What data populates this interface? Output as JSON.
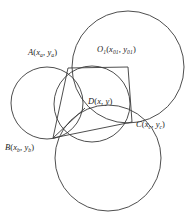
{
  "figure": {
    "kind": "geometry-diagram",
    "background_color": "#ffffff",
    "stroke_color": "#3a3a3a",
    "text_color": "#1c1c1c",
    "width": 189,
    "height": 224
  },
  "labels": {
    "a": {
      "point": "A",
      "coords": "(x_a, y_a)",
      "x": 28,
      "y": 48
    },
    "o1": {
      "point": "O",
      "subscript": "1",
      "coords": "(x_01, y_01)",
      "x": 97,
      "y": 45
    },
    "d": {
      "point": "D",
      "coords": "(x, y)",
      "x": 88,
      "y": 97
    },
    "c": {
      "point": "C",
      "coords": "(x_c, y_c)",
      "x": 136,
      "y": 120
    },
    "b": {
      "point": "B",
      "coords": "(x_b, y_b)",
      "x": 5,
      "y": 143
    }
  },
  "points": {
    "A": {
      "x": 68,
      "y": 68
    },
    "O1": {
      "x": 128,
      "y": 67
    },
    "D": {
      "x": 85,
      "y": 108
    },
    "C": {
      "x": 132,
      "y": 122
    },
    "B": {
      "x": 53,
      "y": 138
    }
  },
  "circles": [
    {
      "name": "circle-top-right",
      "cx": 128,
      "cy": 67,
      "r": 56
    },
    {
      "name": "circle-left",
      "cx": 47,
      "cy": 103,
      "r": 36
    },
    {
      "name": "circle-bottom",
      "cx": 108,
      "cy": 158,
      "r": 53
    },
    {
      "name": "circle-center",
      "cx": 92,
      "cy": 104,
      "r": 38
    }
  ],
  "segments": [
    {
      "name": "segment-A-O1",
      "from": "A",
      "to": "O1"
    },
    {
      "name": "segment-O1-C",
      "from": "O1",
      "to": "C"
    },
    {
      "name": "segment-C-B",
      "from": "C",
      "to": "B"
    },
    {
      "name": "segment-B-A",
      "from": "B",
      "to": "A"
    },
    {
      "name": "segment-B-D",
      "from": "B",
      "to": "D"
    }
  ]
}
